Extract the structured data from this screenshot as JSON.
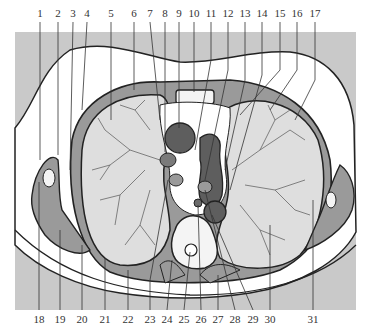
{
  "figure": {
    "type": "anatomical cross-section",
    "colors": {
      "background_band": "#c9c9c9",
      "skin": "#ffffff",
      "lung": "#dedede",
      "muscle": "#9a9a9a",
      "heart_vessels": "#5e5e5e",
      "outline": "#222222",
      "label_text": "#333333"
    },
    "top_labels": [
      {
        "n": "1",
        "x": 40
      },
      {
        "n": "2",
        "x": 58
      },
      {
        "n": "3",
        "x": 73
      },
      {
        "n": "4",
        "x": 87
      },
      {
        "n": "5",
        "x": 111
      },
      {
        "n": "6",
        "x": 134
      },
      {
        "n": "7",
        "x": 150
      },
      {
        "n": "8",
        "x": 165
      },
      {
        "n": "9",
        "x": 179
      },
      {
        "n": "10",
        "x": 194
      },
      {
        "n": "11",
        "x": 211
      },
      {
        "n": "12",
        "x": 228
      },
      {
        "n": "13",
        "x": 245
      },
      {
        "n": "14",
        "x": 262
      },
      {
        "n": "15",
        "x": 280
      },
      {
        "n": "16",
        "x": 297
      },
      {
        "n": "17",
        "x": 315
      }
    ],
    "bottom_labels": [
      {
        "n": "18",
        "x": 39
      },
      {
        "n": "19",
        "x": 60
      },
      {
        "n": "20",
        "x": 82
      },
      {
        "n": "21",
        "x": 105
      },
      {
        "n": "22",
        "x": 128
      },
      {
        "n": "23",
        "x": 150
      },
      {
        "n": "24",
        "x": 167
      },
      {
        "n": "25",
        "x": 184
      },
      {
        "n": "26",
        "x": 201
      },
      {
        "n": "27",
        "x": 218
      },
      {
        "n": "28",
        "x": 235
      },
      {
        "n": "29",
        "x": 253
      },
      {
        "n": "30",
        "x": 270
      },
      {
        "n": "31",
        "x": 313
      }
    ]
  }
}
